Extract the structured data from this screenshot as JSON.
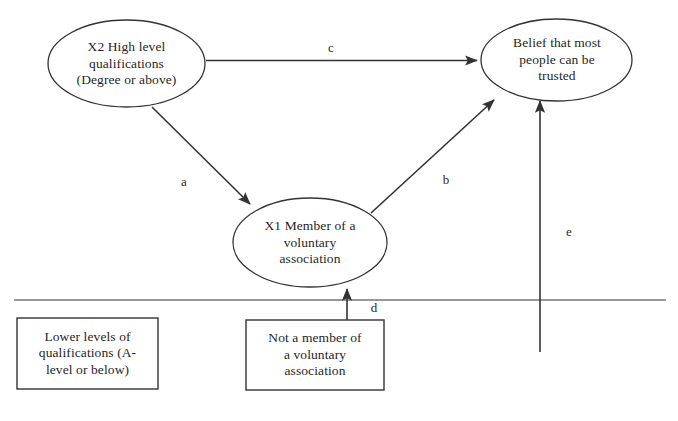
{
  "figure": {
    "type": "path-diagram",
    "background_color": "#ffffff",
    "stroke_color": "#333333",
    "text_color": "#1f1f1f"
  },
  "nodes": {
    "x2_qualifications": {
      "shape": "ellipse",
      "lines": [
        "X2 High level",
        "qualifications",
        "(Degree or above)"
      ]
    },
    "belief_trust": {
      "shape": "ellipse",
      "lines": [
        "Belief that most",
        "people can be",
        "trusted"
      ]
    },
    "x1_member": {
      "shape": "ellipse",
      "lines": [
        "X1 Member of a",
        "voluntary",
        "association"
      ]
    },
    "lower_qualifications": {
      "shape": "rectangle",
      "lines": [
        "Lower levels of",
        "qualifications (A-",
        "level or below)"
      ]
    },
    "not_member": {
      "shape": "rectangle",
      "lines": [
        "Not a member of",
        "a voluntary",
        "association"
      ]
    }
  },
  "paths": {
    "a": {
      "label": "a",
      "from": "x2_qualifications",
      "to": "x1_member"
    },
    "b": {
      "label": "b",
      "from": "x1_member",
      "to": "belief_trust"
    },
    "c": {
      "label": "c",
      "from": "x2_qualifications",
      "to": "belief_trust"
    },
    "d": {
      "label": "d",
      "from": "not_member",
      "to": "x1_member"
    },
    "e": {
      "label": "e",
      "from": "reference-baseline",
      "to": "belief_trust"
    }
  },
  "divider": {
    "name": "reference-category-baseline"
  }
}
